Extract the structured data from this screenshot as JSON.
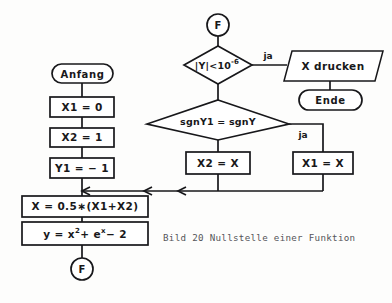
{
  "diagram": {
    "caption": "Bild 20 Nullstelle einer Funktion",
    "colors": {
      "background": "#fdfdfc",
      "stroke": "#17171a",
      "shape_fill": "#ffffff",
      "caption_text": "#55555a"
    },
    "connectors": {
      "top": "F",
      "bottom": "F"
    },
    "nodes": {
      "start": "Anfang",
      "init_x1": "X1 = 0",
      "init_x2": "X2 = 1",
      "init_y1": "Y1 = − 1",
      "bisect": "X = 0.5∗(X1+X2)",
      "function_lhs": "y = x",
      "function_exp1": "2",
      "function_mid": "+ e",
      "function_exp2": "x",
      "function_tail": "− 2",
      "test_abs": "|Y|<10",
      "test_abs_exp": "-6",
      "test_sign": "sgnY1 = sgnY",
      "print": "X drucken",
      "end": "Ende",
      "assign_x2": "X2 = X",
      "assign_x1": "X1 = X"
    },
    "branch_labels": {
      "abs_yes": "ja",
      "sign_yes": "ja"
    }
  }
}
